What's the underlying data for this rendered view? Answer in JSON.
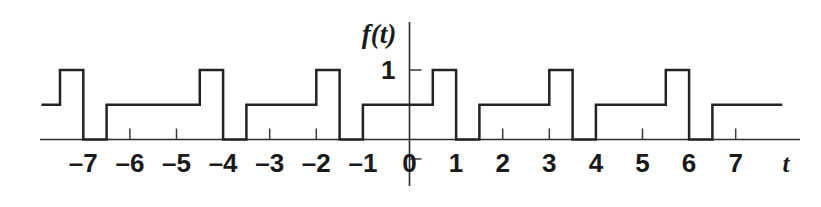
{
  "figure": {
    "kind": "waveform-plot",
    "background_color": "#ffffff",
    "line_color": "#232323",
    "axis_color": "#2b2b2b",
    "text_color": "#1a1a1a"
  },
  "axes": {
    "x_axis_label": "t",
    "y_axis_label": "f(t)",
    "x_tick_labels": [
      "–7",
      "–6",
      "–5",
      "–4",
      "–3",
      "–2",
      "–1",
      "0",
      "1",
      "2",
      "3",
      "4",
      "5",
      "6",
      "7"
    ],
    "x_tick_values": [
      -7,
      -6,
      -5,
      -4,
      -3,
      -2,
      -1,
      0,
      1,
      2,
      3,
      4,
      5,
      6,
      7
    ],
    "y_tick_labels": [
      "1"
    ],
    "y_tick_values": [
      1
    ],
    "x_range": [
      -7.9,
      8.0
    ],
    "y_range": [
      -0.45,
      1.55
    ],
    "grid": false,
    "legend": false
  },
  "chart_data": {
    "type": "line",
    "title": "",
    "xlabel": "t",
    "ylabel": "f(t)",
    "xlim": [
      -7.9,
      8.0
    ],
    "ylim": [
      -0.45,
      1.55
    ],
    "grid": false,
    "legend_position": "none",
    "period": 2.5,
    "levels": [
      0,
      0.5,
      1
    ],
    "series": [
      {
        "name": "f(t)",
        "step": "post",
        "x": [
          -7.9,
          -7.5,
          -7.5,
          -7.0,
          -7.0,
          -6.5,
          -6.5,
          -6.0,
          -6.0,
          -4.5,
          -4.5,
          -4.0,
          -4.0,
          -3.5,
          -3.5,
          -2.0,
          -2.0,
          -1.5,
          -1.5,
          -1.0,
          -1.0,
          0.5,
          0.5,
          1.0,
          1.0,
          1.5,
          1.5,
          3.0,
          3.0,
          3.5,
          3.5,
          4.0,
          4.0,
          5.5,
          5.5,
          6.0,
          6.0,
          6.5,
          6.5,
          8.0
        ],
        "y": [
          0.5,
          0.5,
          1.0,
          1.0,
          0.0,
          0.0,
          0.5,
          0.5,
          0.5,
          0.5,
          1.0,
          1.0,
          0.0,
          0.0,
          0.5,
          0.5,
          1.0,
          1.0,
          0.0,
          0.0,
          0.5,
          0.5,
          1.0,
          1.0,
          0.0,
          0.0,
          0.5,
          0.5,
          1.0,
          1.0,
          0.0,
          0.0,
          0.5,
          0.5,
          1.0,
          1.0,
          0.0,
          0.0,
          0.5,
          0.5
        ]
      }
    ],
    "segments": [
      {
        "from": -7.9,
        "to": -7.5,
        "value": 0.5
      },
      {
        "from": -7.5,
        "to": -7.0,
        "value": 1
      },
      {
        "from": -7.0,
        "to": -6.5,
        "value": 0
      },
      {
        "from": -6.5,
        "to": -5.0,
        "value": 0.5
      },
      {
        "from": -5.0,
        "to": -4.5,
        "value": 0.5
      },
      {
        "from": -4.5,
        "to": -4.0,
        "value": 1
      },
      {
        "from": -4.0,
        "to": -3.5,
        "value": 0
      },
      {
        "from": -3.5,
        "to": -2.0,
        "value": 0.5
      },
      {
        "from": -2.0,
        "to": -1.5,
        "value": 1
      },
      {
        "from": -1.5,
        "to": -1.0,
        "value": 0
      },
      {
        "from": -1.0,
        "to": 0.5,
        "value": 0.5
      },
      {
        "from": 0.5,
        "to": 1.0,
        "value": 1
      },
      {
        "from": 1.0,
        "to": 1.5,
        "value": 0
      },
      {
        "from": 1.5,
        "to": 3.0,
        "value": 0.5
      },
      {
        "from": 3.0,
        "to": 3.5,
        "value": 1
      },
      {
        "from": 3.5,
        "to": 4.0,
        "value": 0
      },
      {
        "from": 4.0,
        "to": 5.5,
        "value": 0.5
      },
      {
        "from": 5.5,
        "to": 6.0,
        "value": 1
      },
      {
        "from": 6.0,
        "to": 6.5,
        "value": 0
      },
      {
        "from": 6.5,
        "to": 8.0,
        "value": 0.5
      }
    ]
  }
}
